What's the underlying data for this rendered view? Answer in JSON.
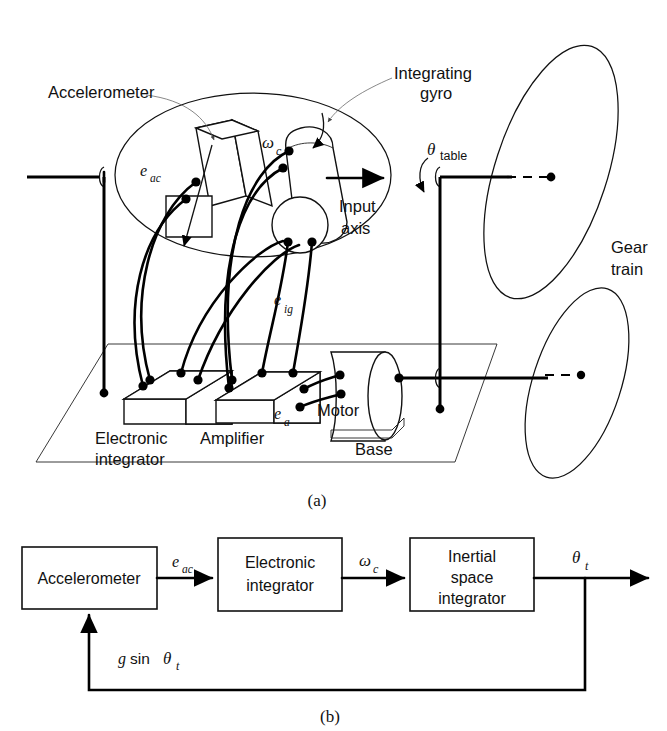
{
  "figure": {
    "panel_a": {
      "caption": "(a)",
      "labels": {
        "accelerometer": "Accelerometer",
        "integrating_gyro_line1": "Integrating",
        "integrating_gyro_line2": "gyro",
        "input_axis_line1": "Input",
        "input_axis_line2": "axis",
        "gear_train_line1": "Gear",
        "gear_train_line2": "train",
        "electronic_integrator_line1": "Electronic",
        "electronic_integrator_line2": "integrator",
        "amplifier": "Amplifier",
        "motor": "Motor",
        "base": "Base"
      },
      "signals": {
        "e_ac_base": "e",
        "e_ac_sub": "ac",
        "omega_c_base": "ω",
        "omega_c_sub": "c",
        "e_ig_base": "e",
        "e_ig_sub": "ig",
        "e_a_base": "e",
        "e_a_sub": "a",
        "theta_table_base": "θ",
        "theta_table_sub": "table"
      }
    },
    "panel_b": {
      "caption": "(b)",
      "blocks": [
        {
          "id": "accelerometer",
          "label_line1": "Accelerometer",
          "label_line2": ""
        },
        {
          "id": "electronic-integrator",
          "label_line1": "Electronic",
          "label_line2": "integrator"
        },
        {
          "id": "inertial-space-integrator",
          "label_line1": "Inertial",
          "label_line2": "space",
          "label_line3": "integrator"
        }
      ],
      "signals": {
        "e_ac_base": "e",
        "e_ac_sub": "ac",
        "omega_c_base": "ω",
        "omega_c_sub": "c",
        "theta_t_base": "θ",
        "theta_t_sub": "t",
        "feedback_g": "g",
        "feedback_sin": "sin",
        "feedback_theta": "θ",
        "feedback_sub": "t"
      }
    }
  },
  "colors": {
    "ink": "#111111",
    "background": "#ffffff",
    "hairline": "#555555"
  }
}
